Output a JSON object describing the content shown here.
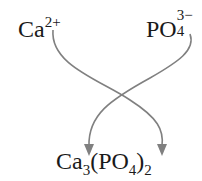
{
  "diagram": {
    "cation": {
      "symbol": "Ca",
      "charge": "2+"
    },
    "anion": {
      "symbol": "PO",
      "subscript": "4",
      "charge": "3−"
    },
    "product": {
      "part1": "Ca",
      "sub1": "3",
      "part2": "(PO",
      "sub2": "4",
      "part3": ")",
      "sub3": "2"
    },
    "arrow_color": "#808080",
    "arrows": [
      {
        "from": "cation-charge",
        "to": "product-subscript-2"
      },
      {
        "from": "anion-charge",
        "to": "product-subscript-3"
      }
    ]
  }
}
